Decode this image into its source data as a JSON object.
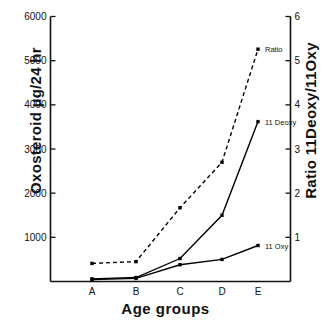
{
  "chart_data": {
    "type": "line",
    "title": "",
    "xlabel": "Age groups",
    "ylabel": "Oxosteroid µg/24 hr",
    "ylabel_right": "Ratio 11Deoxy/11Oxy",
    "categories": [
      "A",
      "B",
      "C",
      "D",
      "E"
    ],
    "xtick_labels": [
      "A",
      "B",
      "C",
      "D",
      "E"
    ],
    "ylim": [
      0,
      6000
    ],
    "ytick_labels": [
      "1000",
      "2000",
      "3000",
      "4000",
      "5000",
      "6000"
    ],
    "yticks": [
      1000,
      2000,
      3000,
      4000,
      5000,
      6000
    ],
    "ylim_right": [
      0,
      6
    ],
    "ytick_labels_right": [
      "1",
      "2",
      "3",
      "4",
      "5",
      "6"
    ],
    "yticks_right": [
      1,
      2,
      3,
      4,
      5,
      6
    ],
    "grid": false,
    "legend_position": "inline-annotations",
    "series": [
      {
        "name": "11 Deoxy",
        "label": "11 Deoxy",
        "axis": "left",
        "style": "solid",
        "marker": "square",
        "color": "#000000",
        "values": [
          60,
          90,
          520,
          1500,
          3620
        ]
      },
      {
        "name": "11 Oxy",
        "label": "11 Oxy",
        "axis": "left",
        "style": "solid",
        "marker": "square",
        "color": "#000000",
        "values": [
          45,
          70,
          380,
          500,
          815
        ]
      },
      {
        "name": "Ratio",
        "label": "Ratio",
        "axis": "right",
        "style": "dashed",
        "marker": "square",
        "color": "#000000",
        "values": [
          0.41,
          0.45,
          1.67,
          2.7,
          5.26
        ]
      }
    ],
    "annotations": [
      {
        "text": "Ratio",
        "series": "Ratio",
        "at_category": "E"
      },
      {
        "text": "11 Deoxy",
        "series": "11 Deoxy",
        "at_category": "E"
      },
      {
        "text": "11 Oxy",
        "series": "11 Oxy",
        "at_category": "E"
      }
    ]
  }
}
